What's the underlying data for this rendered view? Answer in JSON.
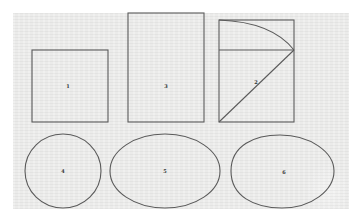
{
  "figure": {
    "background_color": "#ebebea",
    "stroke_color": "#5a5a5a",
    "shapes": [
      {
        "id": "square",
        "type": "rect",
        "label": "1",
        "x": 32,
        "y": 50,
        "w": 76,
        "h": 72,
        "label_pos": [
          68,
          88
        ]
      },
      {
        "id": "tall-rectangle",
        "type": "rect",
        "label": "3",
        "x": 128,
        "y": 13,
        "w": 76,
        "h": 109,
        "label_pos": [
          166,
          88
        ]
      },
      {
        "id": "construction-rectangle",
        "type": "rect-construction",
        "label": "2",
        "x": 219,
        "y": 20,
        "w": 75,
        "h": 102,
        "divider_y": 50,
        "label_pos": [
          256,
          84
        ]
      },
      {
        "id": "circle",
        "type": "ellipse",
        "label": "4",
        "cx": 63,
        "cy": 171,
        "rx": 38,
        "ry": 37,
        "label_pos": [
          63,
          173
        ]
      },
      {
        "id": "ellipse",
        "type": "ellipse",
        "label": "5",
        "cx": 165,
        "cy": 171,
        "rx": 55,
        "ry": 37,
        "label_pos": [
          165,
          173
        ]
      },
      {
        "id": "egg-oval",
        "type": "oval",
        "label": "6",
        "cx": 283,
        "cy": 171,
        "label_pos": [
          284,
          174
        ]
      }
    ]
  }
}
